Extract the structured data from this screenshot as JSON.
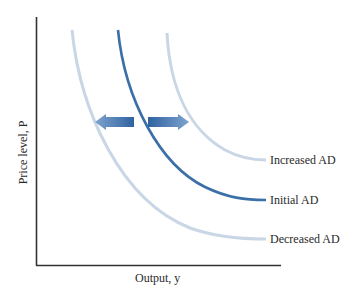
{
  "diagram": {
    "x_axis_label": "Output, y",
    "y_axis_label": "Price level, P",
    "curves": [
      {
        "name": "Increased AD",
        "color": "#c9d6e6",
        "style": "light"
      },
      {
        "name": "Initial AD",
        "color": "#3a6fa8",
        "style": "dark"
      },
      {
        "name": "Decreased AD",
        "color": "#c9d6e6",
        "style": "light"
      }
    ],
    "arrows": [
      {
        "direction": "left",
        "meaning": "decrease in AD"
      },
      {
        "direction": "right",
        "meaning": "increase in AD"
      }
    ],
    "colors": {
      "axis": "#333333",
      "initial": "#3a6fa8",
      "shifted": "#c9d6e6",
      "arrow": "#4a78b5"
    }
  },
  "labels": {
    "increased": "Increased AD",
    "initial": "Initial AD",
    "decreased": "Decreased AD",
    "x_axis": "Output, y",
    "y_axis": "Price level, P"
  }
}
